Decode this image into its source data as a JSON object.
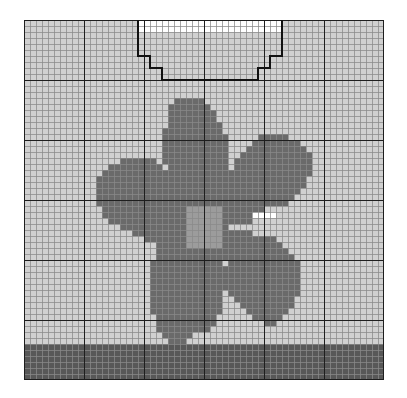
{
  "pattern": {
    "title": "Flower knitting chart",
    "cols": 60,
    "rows": 60,
    "cell_px": 6,
    "major_every": 10,
    "colors": {
      ".": "#d0d0d0",
      "w": "#ffffff",
      "d": "#6a6a6a",
      "c": "#9c9c9c",
      "b": "#585858",
      "minor_line": "#8a8a8a",
      "major_line": "#1e1e1e",
      "outline": "#111111"
    },
    "legend": [
      {
        "key": ".",
        "label": "Background"
      },
      {
        "key": "w",
        "label": "Neck opening"
      },
      {
        "key": "d",
        "label": "Petal"
      },
      {
        "key": "c",
        "label": "Flower center"
      },
      {
        "key": "b",
        "label": "Ribbing band"
      }
    ],
    "neckline_path": [
      [
        19,
        0
      ],
      [
        19,
        6
      ],
      [
        21,
        6
      ],
      [
        21,
        8
      ],
      [
        23,
        8
      ],
      [
        23,
        10
      ],
      [
        39,
        10
      ],
      [
        39,
        8
      ],
      [
        41,
        8
      ],
      [
        41,
        6
      ],
      [
        43,
        6
      ],
      [
        43,
        0
      ]
    ],
    "shapes": [
      {
        "key": "w",
        "rect": [
          19,
          0,
          24,
          2
        ]
      },
      {
        "key": "d",
        "rows": [
          [
            13,
            25,
            30
          ],
          [
            14,
            24,
            31
          ],
          [
            15,
            24,
            32
          ],
          [
            16,
            24,
            32
          ],
          [
            17,
            24,
            33
          ],
          [
            18,
            23,
            33
          ],
          [
            19,
            23,
            34
          ],
          [
            20,
            23,
            34
          ],
          [
            21,
            23,
            34
          ],
          [
            22,
            23,
            34
          ],
          [
            23,
            23,
            34
          ],
          [
            24,
            24,
            34
          ],
          [
            25,
            24,
            34
          ],
          [
            26,
            24,
            34
          ],
          [
            27,
            25,
            34
          ],
          [
            28,
            25,
            34
          ],
          [
            29,
            26,
            34
          ],
          [
            30,
            26,
            34
          ]
        ]
      },
      {
        "key": "d",
        "rows": [
          [
            23,
            16,
            22
          ],
          [
            24,
            14,
            23
          ],
          [
            25,
            13,
            24
          ],
          [
            26,
            12,
            26
          ],
          [
            27,
            12,
            27
          ],
          [
            28,
            12,
            28
          ],
          [
            29,
            12,
            29
          ],
          [
            30,
            12,
            30
          ],
          [
            31,
            13,
            30
          ],
          [
            32,
            13,
            30
          ],
          [
            33,
            14,
            30
          ],
          [
            34,
            16,
            30
          ],
          [
            35,
            18,
            30
          ],
          [
            36,
            20,
            30
          ],
          [
            37,
            22,
            30
          ]
        ]
      },
      {
        "key": "d",
        "rows": [
          [
            19,
            39,
            44
          ],
          [
            20,
            38,
            46
          ],
          [
            21,
            37,
            47
          ],
          [
            22,
            36,
            48
          ],
          [
            23,
            35,
            48
          ],
          [
            24,
            35,
            48
          ],
          [
            25,
            34,
            48
          ],
          [
            26,
            34,
            47
          ],
          [
            27,
            34,
            47
          ],
          [
            28,
            34,
            46
          ],
          [
            29,
            34,
            45
          ],
          [
            30,
            34,
            44
          ],
          [
            31,
            34,
            40
          ],
          [
            32,
            34,
            39
          ],
          [
            33,
            34,
            38
          ]
        ]
      },
      {
        "key": "d",
        "rows": [
          [
            35,
            34,
            38
          ],
          [
            36,
            34,
            42
          ],
          [
            37,
            34,
            43
          ],
          [
            38,
            34,
            44
          ],
          [
            39,
            34,
            45
          ],
          [
            40,
            34,
            46
          ],
          [
            41,
            33,
            46
          ],
          [
            42,
            33,
            46
          ],
          [
            43,
            33,
            46
          ],
          [
            44,
            33,
            46
          ],
          [
            45,
            34,
            46
          ],
          [
            46,
            35,
            45
          ],
          [
            47,
            36,
            45
          ],
          [
            48,
            37,
            44
          ],
          [
            49,
            38,
            43
          ],
          [
            50,
            40,
            42
          ]
        ]
      },
      {
        "key": "d",
        "rows": [
          [
            37,
            23,
            33
          ],
          [
            38,
            22,
            33
          ],
          [
            39,
            22,
            33
          ],
          [
            40,
            21,
            33
          ],
          [
            41,
            21,
            33
          ],
          [
            42,
            21,
            33
          ],
          [
            43,
            21,
            33
          ],
          [
            44,
            21,
            33
          ],
          [
            45,
            21,
            33
          ],
          [
            46,
            21,
            33
          ],
          [
            47,
            21,
            33
          ],
          [
            48,
            21,
            33
          ],
          [
            49,
            22,
            32
          ],
          [
            50,
            22,
            32
          ],
          [
            51,
            22,
            31
          ],
          [
            52,
            23,
            28
          ],
          [
            53,
            24,
            27
          ]
        ]
      },
      {
        "key": "d",
        "rows": [
          [
            31,
            26,
            34
          ],
          [
            32,
            26,
            34
          ],
          [
            33,
            26,
            34
          ],
          [
            34,
            26,
            34
          ],
          [
            35,
            26,
            34
          ],
          [
            36,
            26,
            34
          ],
          [
            37,
            26,
            34
          ],
          [
            38,
            26,
            34
          ],
          [
            39,
            26,
            34
          ]
        ]
      },
      {
        "key": "w",
        "rect": [
          38,
          32,
          4,
          1
        ]
      },
      {
        "key": "c",
        "rect": [
          27,
          31,
          6,
          7
        ]
      },
      {
        "key": "b",
        "rect": [
          0,
          54,
          60,
          6
        ]
      }
    ]
  }
}
